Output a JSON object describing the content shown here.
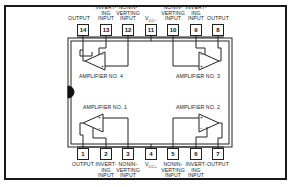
{
  "diagram": {
    "type": "IC pinout - quad operational amplifier (14-pin DIP)",
    "top_pins": [
      {
        "number": "14",
        "label": "OUTPUT"
      },
      {
        "number": "13",
        "label": "INVERT-\nING\nINPUT"
      },
      {
        "number": "12",
        "label": "NONIN-\nVERTING\nINPUT"
      },
      {
        "number": "11",
        "label": "VCC−",
        "label_main": "V",
        "label_sub": "CC−"
      },
      {
        "number": "10",
        "label": "NONIN-\nVERTING\nINPUT"
      },
      {
        "number": "9",
        "label": "INVERT-\nING\nINPUT"
      },
      {
        "number": "8",
        "label": "OUTPUT"
      }
    ],
    "bottom_pins": [
      {
        "number": "1",
        "label": "OUTPUT"
      },
      {
        "number": "2",
        "label": "INVERT-\nING\nINPUT"
      },
      {
        "number": "3",
        "label": "NONIN-\nVERTING\nINPUT"
      },
      {
        "number": "4",
        "label": "VCC+",
        "label_main": "V",
        "label_sub": "CC+"
      },
      {
        "number": "5",
        "label": "NONIN-\nVERTING\nINPUT"
      },
      {
        "number": "6",
        "label": "INVERT-\nING\nINPUT"
      },
      {
        "number": "7",
        "label": "OUTPUT"
      }
    ],
    "amplifiers": [
      {
        "name": "AMPLIFIER NO. 1",
        "plus": "+",
        "minus": "−"
      },
      {
        "name": "AMPLIFIER NO. 2",
        "plus": "+",
        "minus": "−"
      },
      {
        "name": "AMPLIFIER NO. 3",
        "plus": "+",
        "minus": "−"
      },
      {
        "name": "AMPLIFIER NO. 4",
        "plus": "+",
        "minus": "−"
      }
    ],
    "colors": {
      "line": "#222222",
      "background": "#ffffff",
      "frame": "#1a1a1a"
    }
  }
}
